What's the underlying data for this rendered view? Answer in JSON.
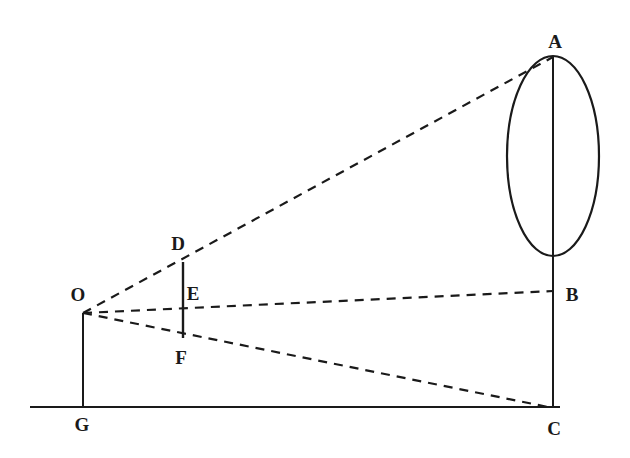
{
  "figure": {
    "kind": "geometry-diagram",
    "width": 630,
    "height": 458,
    "background_color": "#ffffff",
    "stroke_color": "#1a1a1a"
  },
  "labels": {
    "A": "A",
    "B": "B",
    "C": "C",
    "D": "D",
    "E": "E",
    "F": "F",
    "G": "G",
    "O": "O"
  },
  "points": {
    "O": {
      "x": 83,
      "y": 313,
      "label_x": 78,
      "label_y": 294
    },
    "G": {
      "x": 83,
      "y": 407,
      "label_x": 82,
      "label_y": 424
    },
    "A": {
      "x": 553,
      "y": 57,
      "label_x": 555,
      "label_y": 41
    },
    "B": {
      "x": 553,
      "y": 291,
      "label_x": 572,
      "label_y": 294
    },
    "C": {
      "x": 553,
      "y": 408,
      "label_x": 554,
      "label_y": 428
    },
    "D": {
      "x": 183,
      "y": 262,
      "label_x": 178,
      "label_y": 243
    },
    "E": {
      "x": 183,
      "y": 310,
      "label_x": 193,
      "label_y": 293
    },
    "F": {
      "x": 183,
      "y": 338,
      "label_x": 181,
      "label_y": 357
    }
  },
  "solid_segments": [
    {
      "name": "ground-line",
      "x1": 30,
      "y1": 407,
      "x2": 560,
      "y2": 407
    },
    {
      "name": "segment-OG",
      "x1": 83,
      "y1": 313,
      "x2": 83,
      "y2": 407
    },
    {
      "name": "segment-AC",
      "x1": 553,
      "y1": 57,
      "x2": 553,
      "y2": 408
    },
    {
      "name": "segment-DF",
      "x1": 183,
      "y1": 262,
      "x2": 183,
      "y2": 338
    }
  ],
  "dashed_rays": [
    {
      "name": "ray-O-to-A",
      "x1": 83,
      "y1": 313,
      "x2": 553,
      "y2": 57
    },
    {
      "name": "ray-O-to-B",
      "x1": 83,
      "y1": 313,
      "x2": 553,
      "y2": 291
    },
    {
      "name": "ray-O-to-C",
      "x1": 83,
      "y1": 313,
      "x2": 553,
      "y2": 408
    }
  ],
  "ellipse": {
    "name": "object-ellipse",
    "cx": 553,
    "cy": 156,
    "rx": 46,
    "ry": 100
  }
}
